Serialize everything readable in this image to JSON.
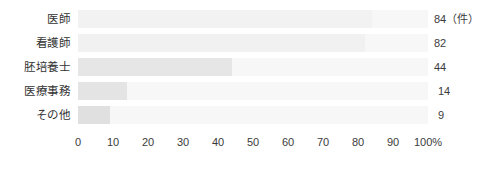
{
  "chart_data": {
    "type": "bar",
    "orientation": "horizontal",
    "title": "",
    "xlabel": "",
    "ylabel": "",
    "categories": [
      "医師",
      "看護師",
      "胚培養士",
      "医療事務",
      "その他"
    ],
    "values": [
      84,
      82,
      44,
      14,
      9
    ],
    "value_unit": "件",
    "value_labels": [
      "84（件）",
      "82",
      "44",
      "14",
      "9"
    ],
    "percent_values": [
      84,
      82,
      44,
      14,
      9
    ],
    "xlim": [
      0,
      100
    ],
    "x_ticks": [
      0,
      10,
      20,
      30,
      40,
      50,
      60,
      70,
      80,
      90,
      100
    ],
    "x_tick_labels": [
      "0",
      "10",
      "20",
      "30",
      "40",
      "50",
      "60",
      "70",
      "80",
      "90",
      "100%"
    ],
    "grid": false,
    "legend": null,
    "bar_track_color": "#f7f7f7",
    "bar_fill_colors": [
      "#f2f2f2",
      "#f1f1f1",
      "#e6e6e6",
      "#e4e4e4",
      "#e0e0e0"
    ],
    "text_color": "#3b3b3b"
  },
  "axis": {
    "x_tick_labels": [
      "0",
      "10",
      "20",
      "30",
      "40",
      "50",
      "60",
      "70",
      "80",
      "90",
      "100%"
    ]
  }
}
